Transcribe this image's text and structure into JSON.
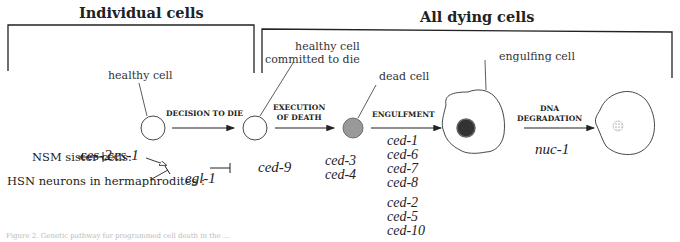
{
  "headers": {
    "individual": "Individual cells",
    "all_dying": "All dying cells"
  },
  "cell_labels": {
    "healthy": "healthy cell",
    "committed_line1": "healthy cell",
    "committed_line2": "committed to die",
    "dead": "dead cell",
    "engulfing": "engulfing cell"
  },
  "steps": {
    "decision": "DECISION TO DIE",
    "execution_line1": "EXECUTION",
    "execution_line2": "OF DEATH",
    "engulfment": "ENGULFMENT",
    "dna_line1": "DNA",
    "dna_line2": "DEGRADATION"
  },
  "regulation": {
    "nsm_label": "NSM sister cells:",
    "hsn_label": "HSN neurons in hermaphrodites :",
    "ces2": "ces-2",
    "ces1": "ces-1",
    "egl1": "egl-1",
    "ced9": "ced-9",
    "ced3": "ced-3",
    "ced4": "ced-4"
  },
  "engulfment_genes": {
    "group1": [
      "ced-1",
      "ced-6",
      "ced-7",
      "ced-8"
    ],
    "group2": [
      "ced-2",
      "ced-5",
      "ced-10"
    ]
  },
  "dna_gene": "nuc-1",
  "caption": "Figure 2.   Genetic pathway for programmed cell death in the ..."
}
